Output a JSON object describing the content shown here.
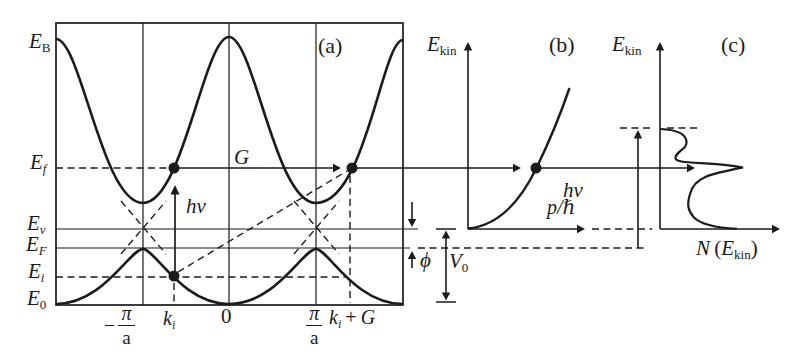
{
  "panel_a": {
    "tag": "(a)",
    "energies": {
      "EB": {
        "base": "E",
        "sub": "B"
      },
      "Ef": {
        "base": "E",
        "sub": "f"
      },
      "Ev": {
        "base": "E",
        "sub": "v"
      },
      "EF": {
        "base": "E",
        "sub": "F"
      },
      "Ei": {
        "base": "E",
        "sub": "i"
      },
      "E0": {
        "base": "E",
        "sub": "0"
      }
    },
    "k_axis": {
      "minus_pi_a": {
        "sign": "−",
        "num": "π",
        "den": "a"
      },
      "ki": {
        "base": "k",
        "sub": "i"
      },
      "zero": "0",
      "pi_a": {
        "num": "π",
        "den": "a"
      },
      "ki_plus_G": {
        "base": "k",
        "sub": "i",
        "plus": "+",
        "vec": "G"
      }
    },
    "photon": "hν",
    "g_vector": "G"
  },
  "annotations": {
    "phi": "ϕ",
    "V0": {
      "base": "V",
      "sub": "0"
    }
  },
  "panel_b": {
    "tag": "(b)",
    "y_axis": {
      "base": "E",
      "sub": "kin"
    },
    "x_axis": "p/ℏ"
  },
  "panel_c": {
    "tag": "(c)",
    "y_axis": {
      "base": "E",
      "sub": "kin"
    },
    "photon": "hν",
    "x_axis": {
      "n": "N",
      "open": "(",
      "base": "E",
      "sub": "kin",
      "close": ")"
    }
  },
  "colors": {
    "ink": "#1b1b1b",
    "background": "#ffffff"
  }
}
